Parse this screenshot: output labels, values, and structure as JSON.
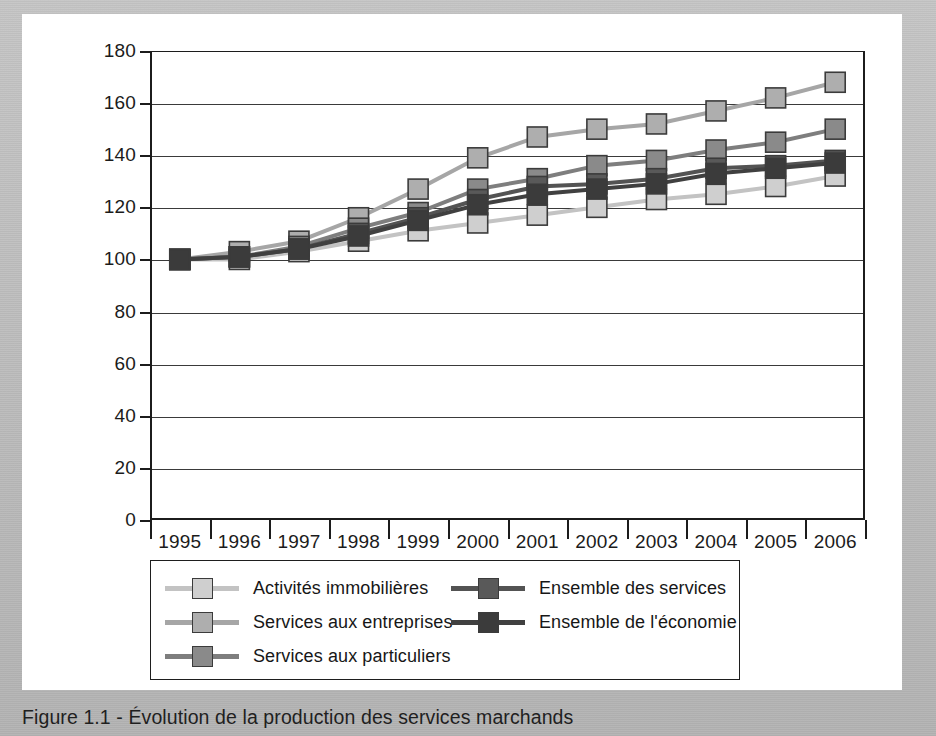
{
  "caption": {
    "text": "Figure 1.1 - Évolution de la production des services marchands"
  },
  "colors": {
    "axis": "#1c1c1c",
    "grid": "#3a3a3a",
    "panel_background": "#ffffff",
    "page_background": "#bdbdbd",
    "marker_border": "#3b3b3b"
  },
  "chart_data": {
    "type": "line",
    "title": "Figure 1.1 - Évolution de la production des services marchands",
    "xlabel": "",
    "ylabel": "",
    "categories": [
      "1995",
      "1996",
      "1997",
      "1998",
      "1999",
      "2000",
      "2001",
      "2002",
      "2003",
      "2004",
      "2005",
      "2006"
    ],
    "ylim": [
      0,
      180
    ],
    "yticks": [
      0,
      20,
      40,
      60,
      80,
      100,
      120,
      140,
      160,
      180
    ],
    "grid": true,
    "legend_position": "below-plot",
    "marker": "square",
    "series": [
      {
        "name": "Activités immobilières",
        "color": "#cfcfcf",
        "line_color": "#c3c3c3",
        "values": [
          100,
          100,
          103,
          107,
          111,
          114,
          117,
          120,
          123,
          125,
          128,
          132
        ]
      },
      {
        "name": "Services aux entreprises",
        "color": "#aeaeae",
        "line_color": "#a6a6a6",
        "values": [
          100,
          103,
          107,
          116,
          127,
          139,
          147,
          150,
          152,
          157,
          162,
          168
        ]
      },
      {
        "name": "Services aux particuliers",
        "color": "#8a8a8a",
        "line_color": "#7e7e7e",
        "values": [
          100,
          101,
          105,
          112,
          118,
          127,
          131,
          136,
          138,
          142,
          145,
          150
        ]
      },
      {
        "name": "Ensemble des services",
        "color": "#595959",
        "line_color": "#535353",
        "values": [
          100,
          101,
          104,
          110,
          116,
          123,
          128,
          129,
          131,
          135,
          136,
          138
        ]
      },
      {
        "name": "Ensemble de l'économie",
        "color": "#3b3b3b",
        "line_color": "#404040",
        "values": [
          100,
          101,
          104,
          109,
          115,
          121,
          125,
          127,
          129,
          133,
          135,
          137
        ]
      }
    ]
  },
  "legend": {
    "left_column": [
      "Activités immobilières",
      "Services aux entreprises",
      "Services aux particuliers"
    ],
    "right_column": [
      "Ensemble des services",
      "Ensemble de l'économie"
    ]
  }
}
